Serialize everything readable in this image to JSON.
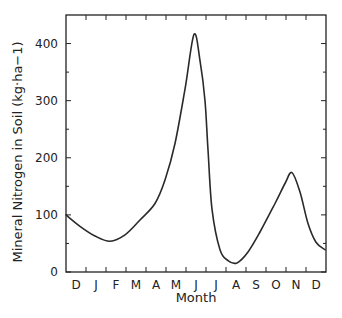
{
  "chart_data": {
    "type": "line",
    "title": "",
    "xlabel": "Month",
    "ylabel": "Mineral Nitrogen in Soil (kg·ha−1)",
    "ylim": [
      0,
      450
    ],
    "yticks": [
      0,
      100,
      200,
      300,
      400
    ],
    "yticks_minor": [
      50,
      150,
      250,
      350
    ],
    "xlim": [
      0,
      13
    ],
    "categories": [
      "D",
      "J",
      "F",
      "M",
      "A",
      "M",
      "J",
      "J",
      "A",
      "S",
      "O",
      "N",
      "D"
    ],
    "grid": false,
    "legend": null,
    "series": [
      {
        "name": "Mineral Nitrogen",
        "x": [
          0,
          0.7,
          1.45,
          2.2,
          2.95,
          3.7,
          4.45,
          4.95,
          5.45,
          5.95,
          6.4,
          6.7,
          6.95,
          7.1,
          7.3,
          7.7,
          8.1,
          8.55,
          9.1,
          9.7,
          10.45,
          10.95,
          11.3,
          11.7,
          12.1,
          12.5,
          12.95
        ],
        "values": [
          100,
          80,
          63,
          54,
          65,
          91,
          120,
          161,
          225,
          320,
          416,
          370,
          300,
          214,
          110,
          39,
          20,
          16,
          35,
          70,
          120,
          155,
          174,
          140,
          85,
          52,
          39
        ]
      }
    ]
  },
  "axes": {
    "x_title": "Month",
    "y_title": "Mineral Nitrogen in Soil (kg·ha−1)",
    "y_tick_labels": [
      "0",
      "100",
      "200",
      "300",
      "400"
    ],
    "x_tick_labels": [
      "D",
      "J",
      "F",
      "M",
      "A",
      "M",
      "J",
      "J",
      "A",
      "S",
      "O",
      "N",
      "D"
    ]
  },
  "colors": {
    "line": "#2a2a2a",
    "axis": "#222222",
    "background": "#ffffff"
  }
}
